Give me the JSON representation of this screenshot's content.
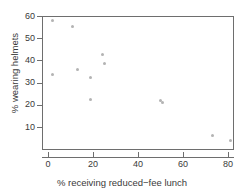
{
  "chart_data": {
    "type": "scatter",
    "title": "",
    "xlabel": "% receiving reduced−fee lunch",
    "ylabel": "% wearing helmets",
    "xlim": [
      -2,
      85
    ],
    "ylim": [
      1,
      62
    ],
    "grid": false,
    "legend": null,
    "x_ticks": [
      {
        "value": 0,
        "label": "0"
      },
      {
        "value": 20,
        "label": "20"
      },
      {
        "value": 40,
        "label": "40"
      },
      {
        "value": 60,
        "label": "60"
      },
      {
        "value": 80,
        "label": "80"
      }
    ],
    "y_ticks": [
      {
        "value": 60,
        "label": "60"
      },
      {
        "value": 50,
        "label": "50"
      },
      {
        "value": 40,
        "label": "40"
      },
      {
        "value": 30,
        "label": "30"
      },
      {
        "value": 20,
        "label": "20"
      },
      {
        "value": 10,
        "label": "10"
      }
    ],
    "marker": {
      "shape": "circle",
      "color": "#b3b3b3",
      "size_px": 3
    },
    "points": [
      {
        "x": 2,
        "y": 58.0
      },
      {
        "x": 2,
        "y": 33.5
      },
      {
        "x": 11,
        "y": 55.2
      },
      {
        "x": 13,
        "y": 36.0
      },
      {
        "x": 19,
        "y": 32.5
      },
      {
        "x": 19,
        "y": 22.2
      },
      {
        "x": 24,
        "y": 42.5
      },
      {
        "x": 25,
        "y": 38.5
      },
      {
        "x": 50,
        "y": 21.9
      },
      {
        "x": 51,
        "y": 21.2
      },
      {
        "x": 73,
        "y": 6.0
      },
      {
        "x": 81,
        "y": 3.8
      }
    ],
    "series": [
      {
        "name": "schools",
        "x": [
          2,
          2,
          11,
          13,
          19,
          19,
          24,
          25,
          50,
          51,
          73,
          81
        ],
        "values": [
          58.0,
          33.5,
          55.2,
          36.0,
          32.5,
          22.2,
          42.5,
          38.5,
          21.9,
          21.2,
          6.0,
          3.8
        ]
      }
    ]
  },
  "colors": {
    "axis": "#6e6e6e",
    "text": "#3a3a3a",
    "marker": "#b3b3b3",
    "background": "#ffffff"
  }
}
